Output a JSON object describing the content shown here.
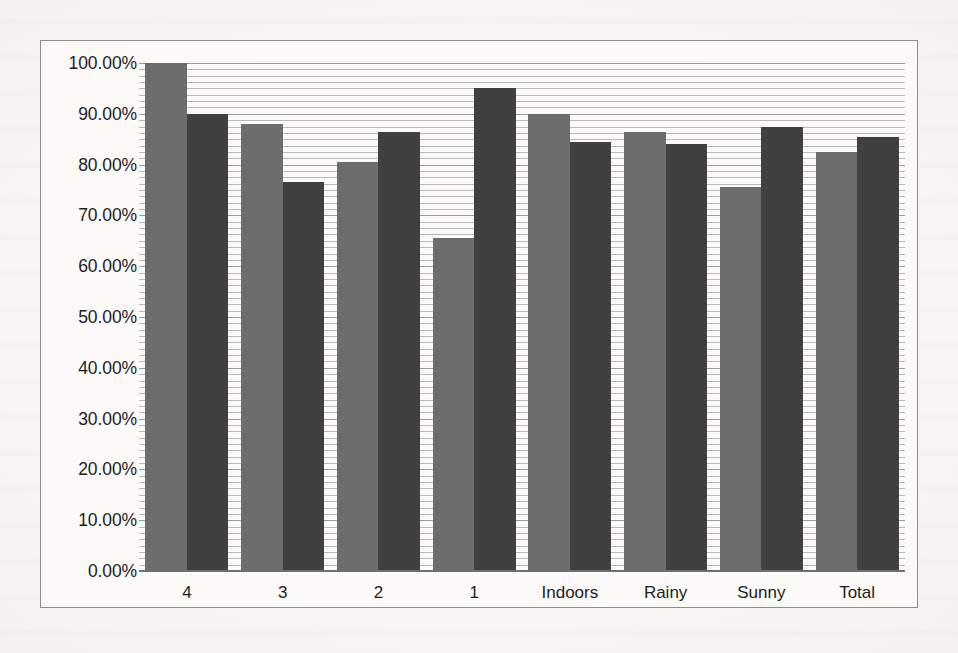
{
  "chart_data": {
    "type": "bar",
    "title": "",
    "subtitle": "",
    "xlabel": "",
    "ylabel": "",
    "categories": [
      "4",
      "3",
      "2",
      "1",
      "Indoors",
      "Rainy",
      "Sunny",
      "Total"
    ],
    "series": [
      {
        "name": "Series 1",
        "color": "#6d6d6d",
        "values": [
          100.0,
          88.0,
          80.5,
          65.5,
          90.0,
          86.5,
          75.5,
          82.5
        ]
      },
      {
        "name": "Series 2",
        "color": "#404040",
        "values": [
          90.0,
          76.5,
          86.5,
          95.0,
          84.5,
          84.0,
          87.5,
          85.5
        ]
      }
    ],
    "ylim": [
      0,
      100
    ],
    "ytick_values": [
      0,
      10,
      20,
      30,
      40,
      50,
      60,
      70,
      80,
      90,
      100
    ],
    "ytick_labels": [
      "0.00%",
      "10.00%",
      "20.00%",
      "30.00%",
      "40.00%",
      "50.00%",
      "60.00%",
      "70.00%",
      "80.00%",
      "90.00%",
      "100.00%"
    ],
    "y_minor_step": 1.25,
    "grid": true,
    "grid_axis": "y",
    "legend": false,
    "legend_position": "none",
    "annotations": [],
    "plot_border": true,
    "border_color": "#8d8d8d",
    "plot_background": "#fbfaf8",
    "page_background": "#f4f2ee"
  }
}
